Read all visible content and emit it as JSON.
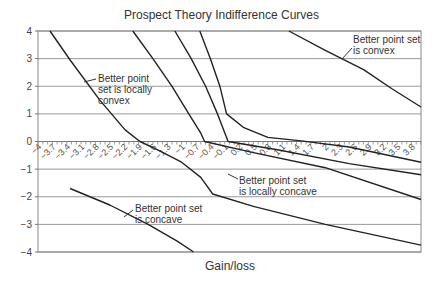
{
  "chart_data": {
    "type": "line",
    "title": "Prospect Theory Indifference Curves",
    "xlabel": "Gain/loss",
    "ylabel": "",
    "xlim": [
      -4,
      4
    ],
    "ylim": [
      -4,
      4
    ],
    "grid": {
      "horizontal": true,
      "vertical": false
    },
    "y_ticks": [
      "4",
      "3",
      "2",
      "1",
      "0",
      "-1",
      "-2",
      "-3",
      "-4"
    ],
    "x_ticks": [
      "-4",
      "-3.7",
      "-3.4",
      "-3.1",
      "-2.8",
      "-2.5",
      "-2.2",
      "-1.9",
      "-1.6",
      "-1.3",
      "-1",
      "-0.7",
      "-0.4",
      "-0.1",
      "0.2",
      "0.5",
      "0.8",
      "1.1",
      "1.4",
      "1.7",
      "2",
      "2.3",
      "2.6",
      "2.9",
      "3.2",
      "3.5",
      "3.8"
    ],
    "series": [
      {
        "name": "curve-1",
        "points": [
          [
            -3.75,
            4
          ],
          [
            -3.33,
            2.95
          ],
          [
            -2.71,
            1.5
          ],
          [
            -2.18,
            0.42
          ],
          [
            -1.87,
            0.0
          ],
          [
            -1.5,
            -0.3
          ],
          [
            -1.0,
            -0.75
          ],
          [
            -0.6,
            -1.3
          ],
          [
            -0.35,
            -1.9
          ],
          [
            0.5,
            -2.35
          ],
          [
            2.0,
            -3.0
          ],
          [
            4.0,
            -3.75
          ]
        ]
      },
      {
        "name": "curve-2",
        "points": [
          [
            -2.02,
            4
          ],
          [
            -1.6,
            3.0
          ],
          [
            -1.2,
            2.0
          ],
          [
            -0.85,
            1.0
          ],
          [
            -0.6,
            0.3
          ],
          [
            -0.52,
            0.0
          ],
          [
            0.5,
            -0.4
          ],
          [
            2.0,
            -0.95
          ],
          [
            4.0,
            -2.1
          ]
        ]
      },
      {
        "name": "curve-3",
        "points": [
          [
            -1.14,
            4
          ],
          [
            -0.8,
            3.0
          ],
          [
            -0.5,
            2.0
          ],
          [
            -0.25,
            1.0
          ],
          [
            -0.03,
            0.0
          ],
          [
            1.0,
            -0.3
          ],
          [
            2.5,
            -0.8
          ],
          [
            4.0,
            -1.2
          ]
        ]
      },
      {
        "name": "curve-4",
        "points": [
          [
            -0.62,
            4
          ],
          [
            -0.4,
            3.0
          ],
          [
            -0.2,
            2.0
          ],
          [
            -0.06,
            1.0
          ],
          [
            0.3,
            0.5
          ],
          [
            0.8,
            0.15
          ],
          [
            1.5,
            0.02
          ],
          [
            2.5,
            -0.2
          ],
          [
            4.0,
            -0.75
          ]
        ]
      },
      {
        "name": "curve-5",
        "points": [
          [
            1.24,
            4
          ],
          [
            2.0,
            3.3
          ],
          [
            2.8,
            2.6
          ],
          [
            3.4,
            1.9
          ],
          [
            4.0,
            1.25
          ]
        ]
      },
      {
        "name": "curve-6",
        "points": [
          [
            -3.33,
            -1.7
          ],
          [
            -2.5,
            -2.3
          ],
          [
            -1.7,
            -3.0
          ],
          [
            -1.1,
            -3.6
          ],
          [
            -0.75,
            -4
          ]
        ]
      }
    ],
    "annotations": [
      {
        "text": "Better point set is convex",
        "lines": [
          "Better point set",
          "is convex"
        ]
      },
      {
        "text": "Better point set is locally convex",
        "lines": [
          "Better point",
          "set is locally",
          "convex"
        ]
      },
      {
        "text": "Better point set is locally concave",
        "lines": [
          "Better point set",
          "is locally concave"
        ]
      },
      {
        "text": "Better point set is concave",
        "lines": [
          "Better point set",
          "is concave"
        ]
      }
    ]
  }
}
